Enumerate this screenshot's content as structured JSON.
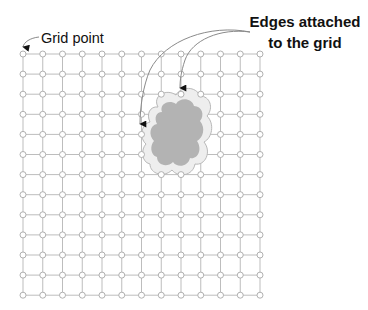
{
  "diagram": {
    "labels": {
      "grid_point": "Grid point",
      "edges_line1": "Edges attached",
      "edges_line2": "to the grid"
    },
    "grid": {
      "columns": 13,
      "rows": 13,
      "origin_x": 23,
      "origin_y": 54,
      "spacing_x": 19.75,
      "spacing_y": 20.1,
      "line_color": "#bdbdbd",
      "node_fill": "#ffffff",
      "node_stroke": "#a8a8a8"
    },
    "blob": {
      "outer_fill": "#eeeeee",
      "outer_stroke": "#b8b8b8",
      "inner_fill": "#b3b3b3"
    },
    "arrow_color": "#111111",
    "leader_color": "#8a8a8a"
  }
}
